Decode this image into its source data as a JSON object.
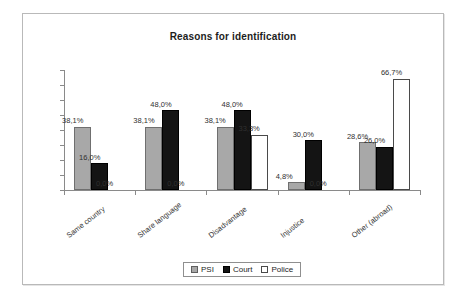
{
  "chart_data": {
    "type": "bar",
    "title": "Reasons for identification",
    "xlabel": "",
    "ylabel": "",
    "ylim": [
      0,
      72
    ],
    "grid": false,
    "legend_position": "bottom",
    "decimal_separator": ",",
    "value_suffix": "%",
    "categories": [
      "Same country",
      "Share language",
      "Disadvantage",
      "Injustice",
      "Other (abroad)"
    ],
    "series": [
      {
        "name": "PSI",
        "color": "#a8a8a8",
        "values": [
          38.1,
          38.1,
          38.1,
          4.8,
          28.6
        ],
        "labels": [
          "38,1%",
          "38,1%",
          "38,1%",
          "4,8%",
          "28,6%"
        ]
      },
      {
        "name": "Court",
        "color": "#141414",
        "values": [
          16.0,
          48.0,
          48.0,
          30.0,
          26.0
        ],
        "labels": [
          "16,0%",
          "48,0%",
          "48,0%",
          "30,0%",
          "26,0%"
        ]
      },
      {
        "name": "Police",
        "color": "#ffffff",
        "values": [
          0.0,
          0.0,
          33.3,
          0.0,
          66.7
        ],
        "labels": [
          "0,0%",
          "0,0%",
          "33,3%",
          "0,0%",
          "66,7%"
        ]
      }
    ]
  },
  "legend": {
    "items": [
      {
        "label": "PSI"
      },
      {
        "label": "Court"
      },
      {
        "label": "Police"
      }
    ]
  }
}
